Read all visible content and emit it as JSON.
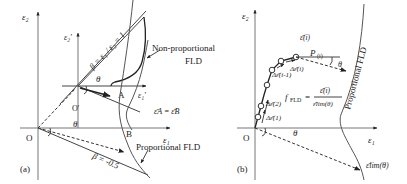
{
  "panel_a": {
    "label": "(a)",
    "axis_e2": "ε₂",
    "axis_e1": "ε₁",
    "axis_e2_prime": "ε₂'",
    "axis_e1_prime": "ε₁'",
    "origin": "O",
    "origin_prime": "O'",
    "beta_1_label": "β = ε₁ / ε₂ = 1",
    "beta_neg_label": "β = -0.5",
    "theta": "θ",
    "theta_main": "θ",
    "point_a": "A",
    "point_b": "B",
    "equal_label": "ε̄A = ε̄B",
    "nonprop_line1": "Non-proportional",
    "nonprop_line2": "FLD",
    "prop_label": "Proportional FLD"
  },
  "panel_b": {
    "label": "(b)",
    "axis_e2": "ε₂",
    "axis_e1": "ε₁",
    "origin": "O",
    "eps_bar_i": "ε̄(i)",
    "point_p": "P",
    "point_p_sub": "(i)",
    "theta": "θ",
    "theta_main": "θ",
    "d_eps_i": "Δε̄(i)",
    "d_eps_i_1": "Δε̄(i-1)",
    "d_eps_2": "Δε̄(2)",
    "d_eps_1": "Δε̄(1)",
    "f_fld": "f",
    "f_fld_sub": "FLD",
    "equals": "=",
    "frac_num": "ε̄(i)",
    "frac_den": "ε̄lim(θ)",
    "prop_label": "Proportional FLD",
    "eps_lim": "ε̄lim(θ)"
  }
}
